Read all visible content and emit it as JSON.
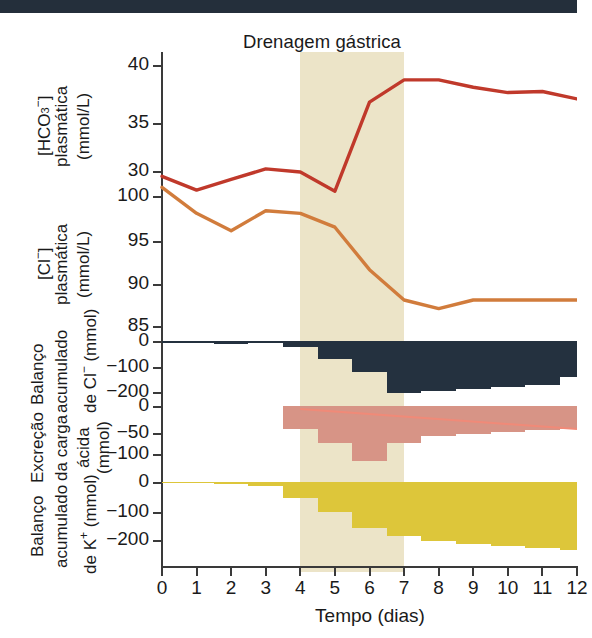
{
  "figure": {
    "title": "Drenagem gástrica",
    "xaxis_title": "Tempo (dias)",
    "x_ticks": [
      "0",
      "1",
      "2",
      "3",
      "4",
      "5",
      "6",
      "7",
      "8",
      "9",
      "10",
      "11",
      "12"
    ]
  },
  "colors": {
    "hco3_line": "#c0392b",
    "cl_line": "#d17c3c",
    "cl_balance_bars": "#24313f",
    "acid_excretion_bars": "#d79486",
    "acid_excretion_trend": "#f08a78",
    "k_balance_bars": "#ddc63a",
    "shaded_band": "#ece4c8",
    "axis": "#3a3a3a",
    "topbar": "#242f3b"
  },
  "panels": [
    {
      "id": "hco3",
      "label_lines": [
        "[HCO3-]",
        "plasmática",
        "(mmol/L)"
      ],
      "label_main": "[HCO",
      "label_sub": "3",
      "label_sup": "−",
      "label_close": "]",
      "label_rest": "plasmática",
      "label_units": "(mmol/L)",
      "y_ticks": [
        "40",
        "35",
        "30"
      ],
      "y_tick_values": [
        40,
        35,
        30
      ],
      "ylim": [
        28,
        40
      ]
    },
    {
      "id": "cl",
      "label_main": "[Cl",
      "label_sup": "−",
      "label_close": "]",
      "label_rest": "plasmática",
      "label_units": "(mmol/L)",
      "y_ticks": [
        "100",
        "95",
        "90",
        "85"
      ],
      "y_tick_values": [
        100,
        95,
        90,
        85
      ],
      "ylim": [
        84,
        102
      ]
    },
    {
      "id": "cl-balance",
      "label_line1": "Balanço",
      "label_line2": "acumulado",
      "label_line3a": "de Cl",
      "label_line3sup": "−",
      "label_line3b": " (mmol)",
      "y_ticks": [
        "0",
        "−100",
        "−200"
      ],
      "y_tick_values": [
        0,
        -100,
        -200
      ],
      "ylim": [
        -230,
        10
      ]
    },
    {
      "id": "acid-excretion",
      "label_line1": "Excreção",
      "label_line2": "da carga",
      "label_line3": "ácida",
      "label_line4": "(mmol)",
      "y_ticks": [
        "0",
        "−50",
        "−100"
      ],
      "y_tick_values": [
        0,
        -50,
        -100
      ],
      "ylim": [
        -125,
        6
      ]
    },
    {
      "id": "k-balance",
      "label_line1": "Balanço",
      "label_line2": "acumulado",
      "label_line3a": "de K",
      "label_line3sup": "+",
      "label_line3b": " (mmol)",
      "y_ticks": [
        "0",
        "−100",
        "−200"
      ],
      "y_tick_values": [
        0,
        -100,
        -200
      ],
      "ylim": [
        -255,
        8
      ]
    }
  ],
  "chart_data": [
    {
      "type": "line",
      "id": "hco3",
      "title": "Drenagem gástrica",
      "ylabel": "[HCO3-] plasmática (mmol/L)",
      "xlabel": "Tempo (dias)",
      "x": [
        0,
        1,
        2,
        3,
        4,
        5,
        6,
        7,
        8,
        9,
        10,
        11,
        12
      ],
      "values": [
        29.5,
        28.2,
        29.2,
        30.2,
        29.9,
        28.1,
        36.5,
        38.6,
        38.6,
        37.9,
        37.4,
        37.5,
        36.8
      ],
      "ylim": [
        28,
        40
      ],
      "yticks": [
        30,
        35,
        40
      ],
      "grid": false,
      "color": "#c0392b"
    },
    {
      "type": "line",
      "id": "cl",
      "ylabel": "[Cl-] plasmática (mmol/L)",
      "xlabel": "Tempo (dias)",
      "x": [
        0,
        1,
        2,
        3,
        4,
        5,
        6,
        7,
        8,
        9,
        10,
        11,
        12
      ],
      "values": [
        101.0,
        98.0,
        96.0,
        98.3,
        98.0,
        96.4,
        91.5,
        88.0,
        87.0,
        88.0,
        88.0,
        88.0,
        88.0
      ],
      "ylim": [
        84,
        102
      ],
      "yticks": [
        85,
        90,
        95,
        100
      ],
      "grid": false,
      "color": "#d17c3c"
    },
    {
      "type": "bar",
      "id": "cl-balance",
      "ylabel": "Balanço acumulado de Cl- (mmol)",
      "xlabel": "Tempo (dias)",
      "categories": [
        "0",
        "1",
        "2",
        "3",
        "4",
        "5",
        "6",
        "7",
        "8",
        "9",
        "10",
        "11",
        "12"
      ],
      "values": [
        -8,
        -8,
        -12,
        -6,
        -25,
        -70,
        -120,
        -205,
        -198,
        -190,
        -180,
        -172,
        -140
      ],
      "ylim": [
        -230,
        10
      ],
      "yticks": [
        0,
        -100,
        -200
      ],
      "grid": false,
      "color": "#24313f"
    },
    {
      "type": "bar",
      "id": "acid-excretion",
      "ylabel": "Excreção da carga ácida (mmol)",
      "xlabel": "Tempo (dias)",
      "categories": [
        "0",
        "1",
        "2",
        "3",
        "4",
        "5",
        "6",
        "7",
        "8",
        "9",
        "10",
        "11",
        "12"
      ],
      "values": [
        0,
        0,
        0,
        0,
        -48,
        -78,
        -115,
        -78,
        -62,
        -58,
        -55,
        -50,
        -48
      ],
      "trend_line": {
        "x": [
          4,
          12
        ],
        "values": [
          -6,
          -48
        ],
        "color": "#f08a78"
      },
      "ylim": [
        -125,
        6
      ],
      "yticks": [
        0,
        -50,
        -100
      ],
      "grid": false,
      "color": "#d79486"
    },
    {
      "type": "bar",
      "id": "k-balance",
      "ylabel": "Balanço acumulado de K+ (mmol)",
      "xlabel": "Tempo (dias)",
      "categories": [
        "0",
        "1",
        "2",
        "3",
        "4",
        "5",
        "6",
        "7",
        "8",
        "9",
        "10",
        "11",
        "12"
      ],
      "values": [
        -2,
        -4,
        -8,
        -14,
        -55,
        -105,
        -160,
        -185,
        -205,
        -215,
        -222,
        -228,
        -235
      ],
      "ylim": [
        -255,
        8
      ],
      "yticks": [
        0,
        -100,
        -200
      ],
      "grid": false,
      "color": "#ddc63a"
    }
  ],
  "annotations": {
    "shaded_band": {
      "label": "Drenagem gástrica",
      "x_start": 4,
      "x_end": 7
    }
  }
}
